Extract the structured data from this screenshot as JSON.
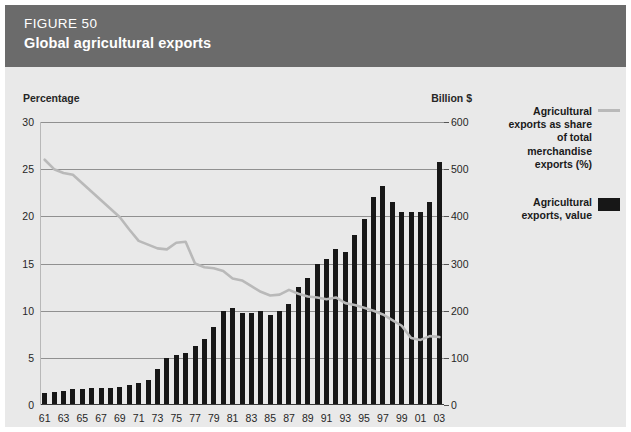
{
  "header": {
    "figure_number": "FIGURE 50",
    "title": "Global agricultural exports",
    "background_color": "#6b6b6b"
  },
  "legend": {
    "line_label": "Agricultural exports as share of total merchandise exports (%)",
    "bar_label": "Agricultural exports, value",
    "line_color": "#b9b9b9",
    "bar_color": "#171717"
  },
  "chart_data": {
    "type": "bar",
    "title": "Global agricultural exports",
    "subtitle": "FIGURE 50",
    "xlabel": "",
    "ylabel": "Percentage",
    "y2label": "Billion $",
    "grid": true,
    "legend_position": "right",
    "axis_title_left": "Percentage",
    "axis_title_right": "Billion $",
    "ylim": [
      0,
      30
    ],
    "y2lim": [
      0,
      600
    ],
    "yticks": [
      0,
      5,
      10,
      15,
      20,
      25,
      30
    ],
    "y2ticks": [
      0,
      100,
      200,
      300,
      400,
      500,
      600
    ],
    "categories": [
      "61",
      "62",
      "63",
      "64",
      "65",
      "66",
      "67",
      "68",
      "69",
      "70",
      "71",
      "72",
      "73",
      "74",
      "75",
      "76",
      "77",
      "78",
      "79",
      "80",
      "81",
      "82",
      "83",
      "84",
      "85",
      "86",
      "87",
      "88",
      "89",
      "90",
      "91",
      "92",
      "93",
      "94",
      "95",
      "96",
      "97",
      "98",
      "99",
      "00",
      "01",
      "02",
      "03"
    ],
    "xtick_labels": [
      "61",
      "63",
      "65",
      "67",
      "69",
      "71",
      "73",
      "75",
      "77",
      "79",
      "81",
      "83",
      "85",
      "87",
      "89",
      "91",
      "93",
      "95",
      "97",
      "99",
      "01",
      "03"
    ],
    "series": [
      {
        "name": "Agricultural exports, value",
        "type": "bar",
        "axis": "right",
        "unit": "Billion $",
        "color": "#171717",
        "values": [
          26,
          27,
          30,
          33,
          34,
          36,
          36,
          36,
          38,
          42,
          46,
          54,
          77,
          100,
          105,
          110,
          125,
          140,
          165,
          200,
          205,
          195,
          195,
          200,
          190,
          200,
          215,
          250,
          270,
          300,
          310,
          330,
          325,
          360,
          395,
          440,
          465,
          430,
          410,
          410,
          410,
          430,
          515
        ]
      },
      {
        "name": "Agricultural exports as share of total merchandise exports (%)",
        "type": "line",
        "axis": "left",
        "unit": "%",
        "color": "#b9b9b9",
        "values": [
          26.0,
          25.0,
          24.6,
          24.4,
          23.5,
          22.6,
          21.7,
          20.8,
          19.9,
          18.6,
          17.4,
          17.0,
          16.6,
          16.5,
          17.2,
          17.3,
          15.0,
          14.6,
          14.5,
          14.2,
          13.4,
          13.2,
          12.6,
          12.0,
          11.6,
          11.7,
          12.2,
          11.8,
          11.5,
          11.4,
          11.2,
          11.4,
          10.8,
          10.6,
          10.3,
          10.0,
          9.6,
          9.0,
          8.4,
          7.1,
          6.9,
          7.3,
          7.2
        ]
      }
    ]
  }
}
